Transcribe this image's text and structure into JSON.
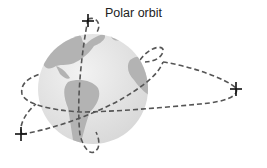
{
  "diagram": {
    "label": "Polar orbit",
    "colors": {
      "globe": "#e6e6e6",
      "land": "#b3b3b3",
      "orbit": "#555555",
      "satellite": "#111111"
    },
    "elements": [
      {
        "type": "globe",
        "description": "Earth showing the Americas and western Africa"
      },
      {
        "type": "orbit",
        "name": "polar orbit",
        "style": "dashed"
      },
      {
        "type": "orbit",
        "name": "equatorial orbit",
        "style": "dashed"
      },
      {
        "type": "orbit",
        "name": "inclined orbit",
        "style": "dashed"
      },
      {
        "type": "satellite",
        "count": 3
      }
    ]
  }
}
